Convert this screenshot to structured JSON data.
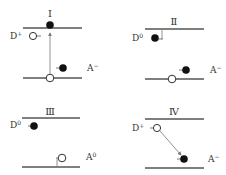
{
  "figure": {
    "colors": {
      "line": "#555555",
      "electron": "#111111",
      "hole_fill": "#ffffff",
      "text": "#333333"
    }
  },
  "panels": [
    {
      "id": "I",
      "label": "Ⅰ",
      "donor_label": "D",
      "donor_sup": "+",
      "acceptor_label": "A",
      "acceptor_sup": "−",
      "description": "Electron excited from valence band to conduction band (vertical arrow)"
    },
    {
      "id": "II",
      "label": "Ⅱ",
      "donor_label": "D",
      "donor_sup": "0",
      "acceptor_label": "A",
      "acceptor_sup": "−",
      "description": "Electron captured by ionized donor"
    },
    {
      "id": "III",
      "label": "Ⅲ",
      "donor_label": "D",
      "donor_sup": "0",
      "acceptor_label": "A",
      "acceptor_sup": "0",
      "description": "Hole captured by ionized acceptor"
    },
    {
      "id": "IV",
      "label": "Ⅳ",
      "donor_label": "D",
      "donor_sup": "+",
      "acceptor_label": "A",
      "acceptor_sup": "−",
      "description": "Donor-acceptor pair recombination (diagonal arrow)"
    }
  ]
}
